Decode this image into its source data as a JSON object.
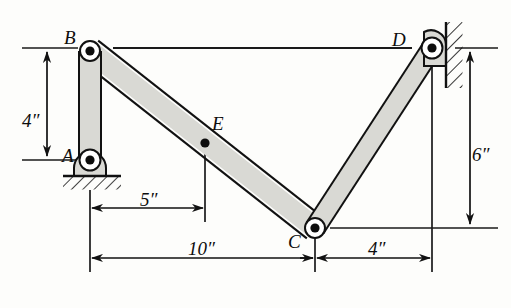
{
  "figure": {
    "type": "mechanism-linkage-diagram",
    "background_color": "#fdfdfb",
    "link_fill": "#d9d9d4",
    "link_stroke": "#111111",
    "pin_color": "#0d0d0d"
  },
  "joints": [
    {
      "id": "A",
      "label": "A",
      "x": 90,
      "y": 160,
      "kind": "pin-support-ground",
      "label_x": 62,
      "label_y": 146
    },
    {
      "id": "B",
      "label": "B",
      "x": 90,
      "y": 51,
      "kind": "pin-joint",
      "label_x": 64,
      "label_y": 28
    },
    {
      "id": "C",
      "label": "C",
      "x": 315,
      "y": 228,
      "kind": "pin-joint",
      "label_x": 288,
      "label_y": 232
    },
    {
      "id": "D",
      "label": "D",
      "x": 432,
      "y": 48,
      "kind": "pin-support-wall",
      "label_x": 392,
      "label_y": 30
    },
    {
      "id": "E",
      "label": "E",
      "x": 205,
      "y": 143,
      "kind": "point-on-link",
      "label_x": 212,
      "label_y": 114
    }
  ],
  "links": [
    {
      "id": "AB",
      "from": "A",
      "to": "B",
      "label": "link AB"
    },
    {
      "id": "BC",
      "from": "B",
      "to": "C",
      "label": "link BC"
    },
    {
      "id": "CD",
      "from": "C",
      "to": "D",
      "label": "link CD"
    }
  ],
  "dimensions": [
    {
      "id": "dim-4in-vertical-left",
      "value": "4″",
      "orientation": "vertical",
      "from": "B level",
      "to": "A level",
      "label_x": 22,
      "label_y": 111
    },
    {
      "id": "dim-5in-horizontal",
      "value": "5″",
      "orientation": "horizontal",
      "from": "A",
      "to": "E",
      "label_x": 140,
      "label_y": 190
    },
    {
      "id": "dim-10in-horizontal",
      "value": "10″",
      "orientation": "horizontal",
      "from": "A",
      "to": "C",
      "label_x": 188,
      "label_y": 239
    },
    {
      "id": "dim-4in-horizontal",
      "value": "4″",
      "orientation": "horizontal",
      "from": "C",
      "to": "wall",
      "label_x": 368,
      "label_y": 239
    },
    {
      "id": "dim-6in-vertical-right",
      "value": "6″",
      "orientation": "vertical",
      "from": "D level",
      "to": "C level",
      "label_x": 472,
      "label_y": 145
    }
  ],
  "supports": [
    {
      "id": "ground-hatch-A",
      "kind": "ground-hatching",
      "x": 63,
      "y": 175,
      "width": 58,
      "height": 14
    },
    {
      "id": "wall-hatch-D",
      "kind": "wall-hatching",
      "x": 446,
      "y": 22,
      "width": 16,
      "height": 66
    }
  ],
  "reference_lines": [
    {
      "id": "horizontal-ref-B-to-D",
      "description": "horizontal datum from B to D",
      "y": 48
    }
  ]
}
